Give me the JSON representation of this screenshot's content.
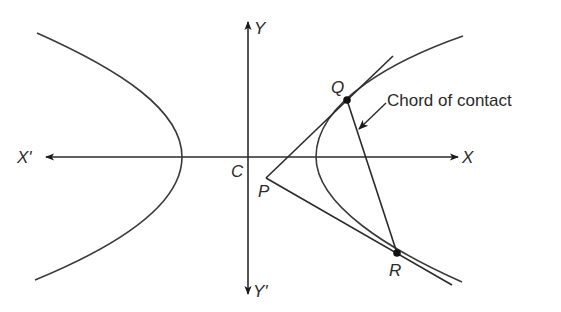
{
  "diagram": {
    "colors": {
      "line": "#2a2a2a",
      "curve": "#3a3a3a",
      "background": "#ffffff"
    },
    "axes": {
      "x_positive_label": "X",
      "x_negative_label": "X'",
      "y_positive_label": "Y",
      "y_negative_label": "Y'",
      "origin_label": "C"
    },
    "points": {
      "external_point": "P",
      "contact_point_upper": "Q",
      "contact_point_lower": "R"
    },
    "annotations": {
      "chord_label": "Chord of contact"
    },
    "geometry": {
      "center": [
        248,
        157
      ],
      "left_branch": {
        "top": [
          37,
          33
        ],
        "vertex": [
          182,
          157
        ],
        "bottom": [
          35,
          280
        ]
      },
      "right_branch": {
        "top": [
          463,
          36
        ],
        "vertex": [
          316,
          157
        ],
        "bottom": [
          462,
          282
        ]
      },
      "P": [
        266,
        178
      ],
      "Q": [
        347,
        100
      ],
      "R": [
        397,
        253
      ],
      "tangent_Q_end": [
        393,
        56
      ],
      "tangent_R_end": [
        452,
        285
      ]
    }
  }
}
